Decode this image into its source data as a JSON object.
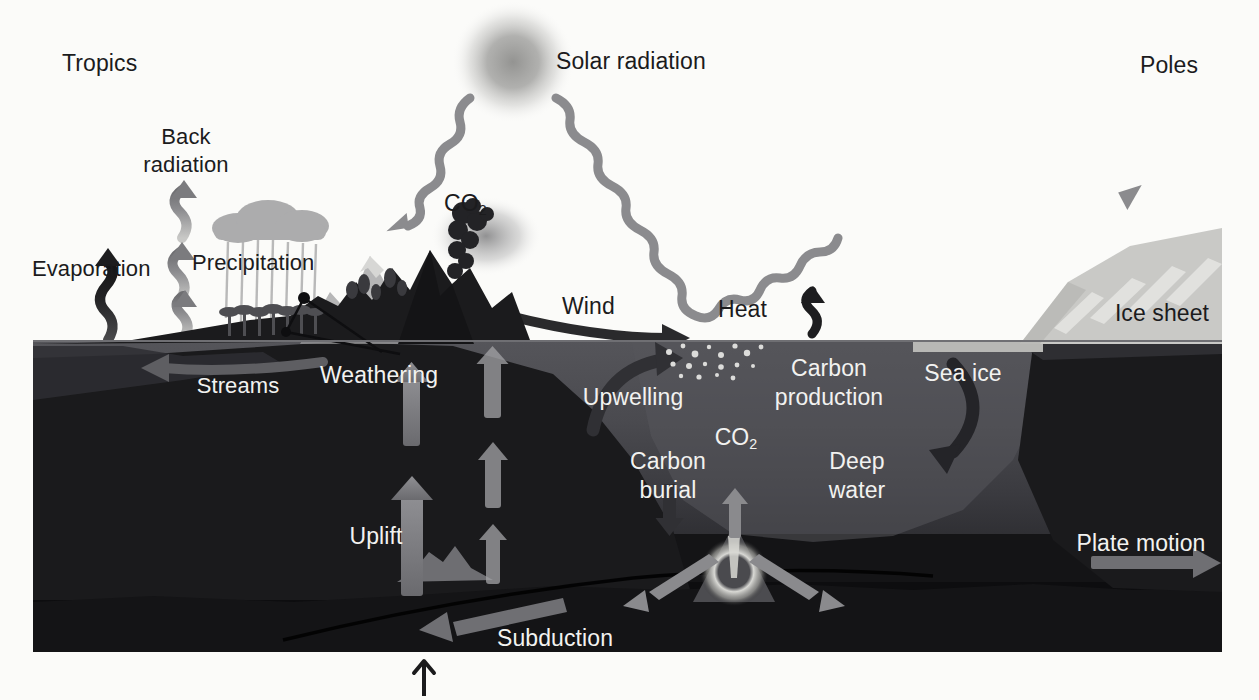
{
  "diagram": {
    "title_semantic": "earth-climate-carbon-cycle-cross-section",
    "regions": {
      "left": "Tropics",
      "right": "Poles"
    },
    "colors": {
      "background": "#fbfbf9",
      "text_dark": "#1b1b1d",
      "text_light": "#f2f2f0",
      "ocean_surface": "#55555a",
      "ocean_deep": "#3a3a3f",
      "crust": "#141416",
      "mantle": "#0d0d0f",
      "arrow_gray": "#7b7b7e",
      "arrow_dark": "#1d1d1f",
      "ice": "#c9c9c6",
      "sun": "#9a9a98"
    }
  },
  "atmosphere": {
    "tropics_label": "Tropics",
    "poles_label": "Poles",
    "solar_radiation_label": "Solar radiation",
    "back_radiation_label_line1": "Back",
    "back_radiation_label_line2": "radiation",
    "evaporation_label": "Evaporation",
    "precipitation_label": "Precipitation",
    "volcanic_co2_label": "CO",
    "volcanic_co2_sub": "2",
    "wind_label": "Wind",
    "heat_label": "Heat",
    "icons": {
      "sun": "sun-icon",
      "incoming_beam": "wavy-incoming-radiation-arrow",
      "outgoing_beam": "wavy-outgoing-radiation-arrow",
      "evaporation_arrow": "squiggle-up-arrow",
      "back_radiation_arrow": "squiggle-up-arrow",
      "rain_cloud": "rain-cloud-icon",
      "volcano_plume": "volcanic-ash-plume-icon",
      "wind_arrow": "curved-right-arrow",
      "heat_arrow": "squiggle-up-arrow"
    }
  },
  "land": {
    "weathering_label": "Weathering",
    "streams_label": "Streams",
    "uplift_label": "Uplift",
    "icons": {
      "mountains": "mountain-range-icon",
      "volcano": "volcano-icon",
      "forest": "tropical-forest-icon",
      "weathering_leaders": "leader-lines-with-dots",
      "streams_arrow": "curved-left-arrow",
      "uplift_arrows": "vertical-up-arrows"
    }
  },
  "ocean": {
    "upwelling_label": "Upwelling",
    "carbon_production_label_line1": "Carbon",
    "carbon_production_label_line2": "production",
    "carbon_burial_label_line1": "Carbon",
    "carbon_burial_label_line2": "burial",
    "ridge_co2_label": "CO",
    "ridge_co2_sub": "2",
    "deep_water_label_line1": "Deep",
    "deep_water_label_line2": "water",
    "sea_ice_label": "Sea ice",
    "ice_sheet_label": "Ice sheet",
    "icons": {
      "upwelling_arrow": "curved-up-right-arrow",
      "plankton_particles": "particle-scatter-icon",
      "burial_arrow": "down-arrow",
      "downwelling_arrow": "curved-down-left-arrow",
      "sea_ice": "sea-ice-icon",
      "ice_sheet": "ice-sheet-icon"
    }
  },
  "lithosphere": {
    "subduction_label": "Subduction",
    "plate_motion_label": "Plate motion",
    "icons": {
      "mid_ocean_ridge": "mid-ocean-ridge-icon",
      "magma_chamber": "magma-chamber-icon",
      "spreading_arrows": "diverging-arrows",
      "subduction_arrow": "left-arrow",
      "plate_motion_arrow": "right-arrow",
      "seamount": "seamount-icon",
      "fault_line": "fault-line",
      "pointer": "up-pointer-arrow"
    }
  }
}
